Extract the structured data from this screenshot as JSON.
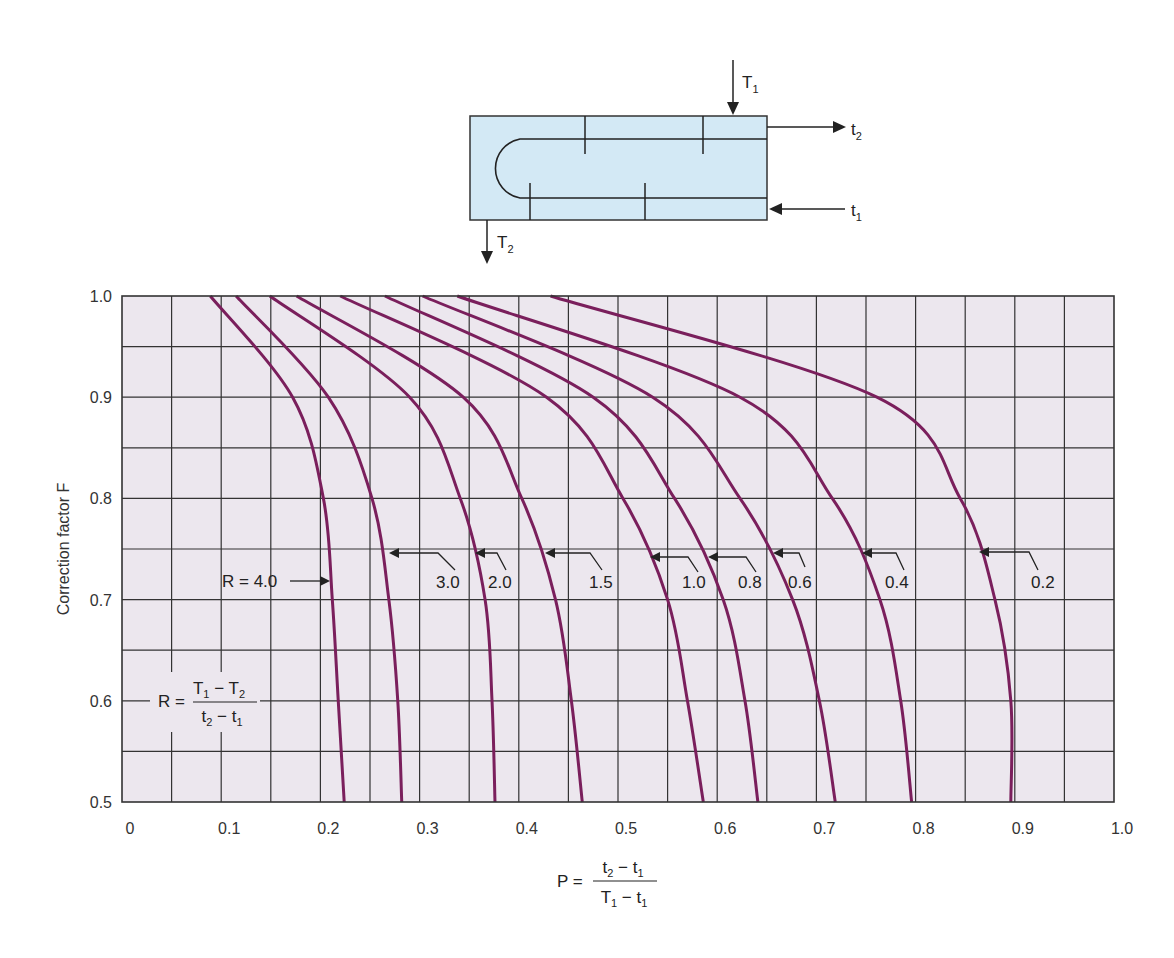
{
  "chart_data": {
    "type": "line",
    "title": "",
    "xlabel": "P = (t2 - t1) / (T1 - t1)",
    "ylabel": "Correction factor F",
    "xlim": [
      0,
      1.0
    ],
    "ylim": [
      0.5,
      1.0
    ],
    "grid": true,
    "x_ticks": [
      "0",
      "0.1",
      "0.2",
      "0.3",
      "0.4",
      "0.5",
      "0.6",
      "0.7",
      "0.8",
      "0.9",
      "1.0"
    ],
    "y_ticks": [
      "0.5",
      "0.6",
      "0.7",
      "0.8",
      "0.9",
      "1.0"
    ],
    "grid_step_x": 0.05,
    "grid_step_y": 0.05,
    "legend_position": "inline labels",
    "series": [
      {
        "name": "R = 4.0",
        "label": "R = 4.0",
        "points": [
          [
            0.089,
            1.0
          ],
          [
            0.172,
            0.9
          ],
          [
            0.203,
            0.8
          ],
          [
            0.212,
            0.7
          ],
          [
            0.218,
            0.6
          ],
          [
            0.224,
            0.5
          ]
        ]
      },
      {
        "name": "R = 3.0",
        "label": "3.0",
        "points": [
          [
            0.115,
            1.0
          ],
          [
            0.208,
            0.9
          ],
          [
            0.252,
            0.8
          ],
          [
            0.269,
            0.7
          ],
          [
            0.278,
            0.6
          ],
          [
            0.282,
            0.5
          ]
        ]
      },
      {
        "name": "R = 2.0",
        "label": "2.0",
        "points": [
          [
            0.149,
            1.0
          ],
          [
            0.29,
            0.9
          ],
          [
            0.341,
            0.8
          ],
          [
            0.366,
            0.7
          ],
          [
            0.373,
            0.6
          ],
          [
            0.376,
            0.5
          ]
        ]
      },
      {
        "name": "R = 1.5",
        "label": "1.5",
        "points": [
          [
            0.176,
            1.0
          ],
          [
            0.344,
            0.9
          ],
          [
            0.403,
            0.8
          ],
          [
            0.437,
            0.7
          ],
          [
            0.453,
            0.6
          ],
          [
            0.464,
            0.5
          ]
        ]
      },
      {
        "name": "R = 1.0",
        "label": "1.0",
        "points": [
          [
            0.22,
            1.0
          ],
          [
            0.428,
            0.9
          ],
          [
            0.505,
            0.8
          ],
          [
            0.55,
            0.7
          ],
          [
            0.57,
            0.6
          ],
          [
            0.586,
            0.5
          ]
        ]
      },
      {
        "name": "R = 0.8",
        "label": "0.8",
        "points": [
          [
            0.265,
            1.0
          ],
          [
            0.475,
            0.9
          ],
          [
            0.557,
            0.8
          ],
          [
            0.606,
            0.7
          ],
          [
            0.628,
            0.6
          ],
          [
            0.641,
            0.5
          ]
        ]
      },
      {
        "name": "R = 0.6",
        "label": "0.6",
        "points": [
          [
            0.303,
            1.0
          ],
          [
            0.535,
            0.9
          ],
          [
            0.623,
            0.8
          ],
          [
            0.676,
            0.7
          ],
          [
            0.703,
            0.6
          ],
          [
            0.719,
            0.5
          ]
        ]
      },
      {
        "name": "R = 0.4",
        "label": "0.4",
        "points": [
          [
            0.338,
            1.0
          ],
          [
            0.623,
            0.9
          ],
          [
            0.716,
            0.8
          ],
          [
            0.764,
            0.7
          ],
          [
            0.785,
            0.6
          ],
          [
            0.796,
            0.5
          ]
        ]
      },
      {
        "name": "R = 0.2",
        "label": "0.2",
        "points": [
          [
            0.432,
            1.0
          ],
          [
            0.761,
            0.9
          ],
          [
            0.845,
            0.8
          ],
          [
            0.88,
            0.7
          ],
          [
            0.896,
            0.6
          ],
          [
            0.896,
            0.5
          ]
        ]
      }
    ],
    "annotations": [
      "R = (T1 - T2) / (t2 - t1)",
      "P = (t2 - t1) / (T1 - t1)"
    ]
  },
  "labels": {
    "y_axis_title": "Correction factor F",
    "r_formula": {
      "lhs": "R =",
      "num": "T1 − T2",
      "den": "t2 − t1"
    },
    "p_formula": {
      "lhs": "P =",
      "num": "t2 − t1",
      "den": "T1 − t1"
    }
  },
  "diagram": {
    "streams": [
      {
        "id": "T1",
        "base": "T",
        "sub": "1",
        "role": "shell inlet (top)"
      },
      {
        "id": "T2",
        "base": "T",
        "sub": "2",
        "role": "shell outlet (bottom)"
      },
      {
        "id": "t1",
        "base": "t",
        "sub": "1",
        "role": "tube inlet"
      },
      {
        "id": "t2",
        "base": "t",
        "sub": "2",
        "role": "tube outlet"
      }
    ],
    "fill_color": "#d3e9f5"
  },
  "colors": {
    "curve": "#7a1f5c",
    "plot_background": "#ece7ee",
    "grid": "#333333"
  }
}
